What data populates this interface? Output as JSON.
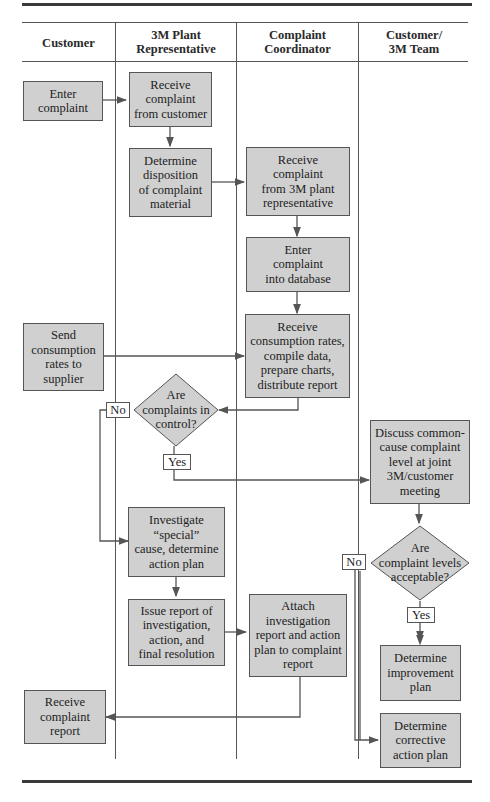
{
  "lanes": [
    {
      "id": "customer",
      "title": "Customer"
    },
    {
      "id": "plant_rep",
      "title": "3M Plant\nRepresentative"
    },
    {
      "id": "coordinator",
      "title": "Complaint\nCoordinator"
    },
    {
      "id": "team",
      "title": "Customer/\n3M Team"
    }
  ],
  "nodes": {
    "enter_complaint": "Enter\ncomplaint",
    "receive_from_customer": "Receive\ncomplaint\nfrom customer",
    "determine_disposition": "Determine\ndisposition\nof complaint\nmaterial",
    "receive_from_rep": "Receive\ncomplaint\nfrom 3M plant\nrepresentative",
    "enter_database": "Enter\ncomplaint\ninto database",
    "send_consumption": "Send\nconsumption\nrates to\nsupplier",
    "receive_consumption": "Receive\nconsumption rates,\ncompile data,\nprepare charts,\ndistribute report",
    "decision_in_control": "Are\ncomplaints in\ncontrol?",
    "discuss_common_cause": "Discuss common-\ncause complaint\nlevel at joint\n3M/customer\nmeeting",
    "investigate_special": "Investigate\n“special”\ncause, determine\naction plan",
    "decision_acceptable": "Are\ncomplaint levels\nacceptable?",
    "issue_report": "Issue report of\ninvestigation,\naction, and\nfinal resolution",
    "attach_report": "Attach\ninvestigation\nreport and action\nplan to complaint\nreport",
    "determine_improvement": "Determine\nimprovement\nplan",
    "receive_report": "Receive\ncomplaint\nreport",
    "determine_corrective": "Determine\ncorrective\naction plan"
  },
  "edge_labels": {
    "control_no": "No",
    "control_yes": "Yes",
    "acceptable_no": "No",
    "acceptable_yes": "Yes"
  },
  "colors": {
    "box_fill": "#d0d0d0",
    "line": "#555555"
  }
}
